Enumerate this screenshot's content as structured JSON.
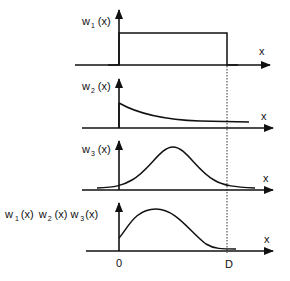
{
  "diagram": {
    "panels": [
      {
        "id": "w1",
        "ylabel_main": "w",
        "ylabel_sub": "1",
        "ylabel_arg": "(x)",
        "xlabel": "x",
        "shape": "rectangle window from 0 to D"
      },
      {
        "id": "w2",
        "ylabel_main": "w",
        "ylabel_sub": "2",
        "ylabel_arg": "(x)",
        "xlabel": "x",
        "shape": "decaying exponential from 0"
      },
      {
        "id": "w3",
        "ylabel_main": "w",
        "ylabel_sub": "3",
        "ylabel_arg": "(x)",
        "xlabel": "x",
        "shape": "gaussian bump"
      },
      {
        "id": "product",
        "ylabel_parts": [
          {
            "main": "w",
            "sub": "1",
            "arg": "(x)"
          },
          {
            "main": "w",
            "sub": "2",
            "arg": "(x)"
          },
          {
            "main": "w",
            "sub": "3",
            "arg": "(x)"
          }
        ],
        "xlabel": "x",
        "shape": "product of windows"
      }
    ],
    "x_ticks": {
      "origin": "0",
      "end": "D"
    },
    "colors": {
      "line": "#111111",
      "background": "#ffffff"
    }
  }
}
